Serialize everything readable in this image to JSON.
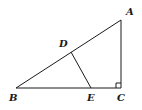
{
  "diagram": {
    "type": "geometry",
    "points": {
      "A": {
        "label": "A",
        "x": 121,
        "y": 20,
        "label_x": 126,
        "label_y": 15
      },
      "B": {
        "label": "B",
        "x": 16,
        "y": 88,
        "label_x": 9,
        "label_y": 101
      },
      "C": {
        "label": "C",
        "x": 121,
        "y": 88,
        "label_x": 117,
        "label_y": 101
      },
      "D": {
        "label": "D",
        "x": 71,
        "y": 52,
        "label_x": 59,
        "label_y": 47
      },
      "E": {
        "label": "E",
        "x": 91,
        "y": 88,
        "label_x": 87,
        "label_y": 101
      }
    },
    "segments": [
      {
        "from": "A",
        "to": "B"
      },
      {
        "from": "B",
        "to": "C"
      },
      {
        "from": "C",
        "to": "A"
      },
      {
        "from": "D",
        "to": "E"
      }
    ],
    "right_angle_marker": {
      "at": "C",
      "size": 5
    },
    "colors": {
      "stroke": "#1a1a1a",
      "background": "#ffffff"
    }
  }
}
